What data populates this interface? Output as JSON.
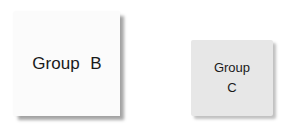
{
  "nodes": [
    {
      "id": "group-b",
      "label": "Group  B"
    },
    {
      "id": "group-c",
      "label_line1": "Group",
      "label_line2": "C"
    }
  ]
}
